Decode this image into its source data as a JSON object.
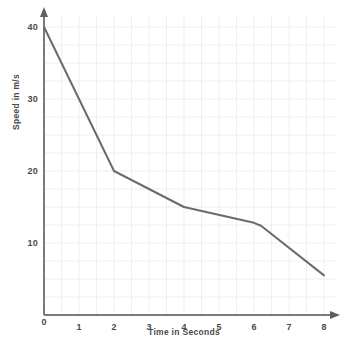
{
  "chart_data": {
    "type": "line",
    "title": "",
    "xlabel": "Time in Seconds",
    "ylabel": "Speed in m/s",
    "xlim": [
      0,
      8
    ],
    "ylim": [
      0,
      40
    ],
    "grid": true,
    "grid_step_x": 0.5,
    "grid_step_y": 2.5,
    "legend": "none",
    "x_ticks": [
      "0",
      "1",
      "2",
      "3",
      "4",
      "5",
      "6",
      "7",
      "8"
    ],
    "y_ticks": [
      "0",
      "10",
      "20",
      "30",
      "40"
    ],
    "x": [
      0,
      2,
      4,
      6,
      6.2,
      8
    ],
    "values": [
      40,
      20,
      15,
      12.8,
      12.4,
      5.5
    ],
    "series": [
      {
        "name": "Speed",
        "x": [
          0,
          2,
          4,
          6,
          6.2,
          8
        ],
        "values": [
          40,
          20,
          15,
          12.8,
          12.4,
          5.5
        ]
      }
    ]
  },
  "style": {
    "line_color": "#6b6b6b",
    "axis_color": "#7a7a7a",
    "grid_color": "#eceef6",
    "text_color": "#4a4a4a",
    "background": "#ffffff"
  },
  "axis": {
    "x_title": "Time in Seconds",
    "y_title": "Speed in m/s"
  }
}
